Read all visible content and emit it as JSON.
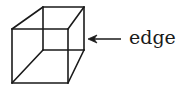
{
  "diagram": {
    "title": "",
    "label": "edge",
    "stroke_color": "#1a1a1a",
    "cube": {
      "front_face": {
        "tl": [
          12,
          29
        ],
        "tr": [
          68,
          29
        ],
        "br": [
          68,
          83
        ],
        "bl": [
          12,
          83
        ]
      },
      "back_face": {
        "tl": [
          43,
          7
        ],
        "tr": [
          84,
          7
        ],
        "br": [
          84,
          50
        ],
        "bl": [
          43,
          50
        ]
      }
    },
    "arrow": {
      "from": [
        121,
        39
      ],
      "to": [
        88,
        39
      ],
      "points_to": "right edge of cube"
    }
  }
}
